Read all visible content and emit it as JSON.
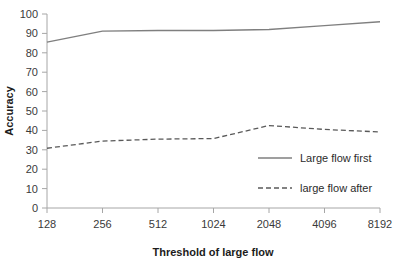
{
  "chart_data": {
    "type": "line",
    "title": "",
    "xlabel": "Threshold of large flow",
    "ylabel": "Accuracy",
    "categories": [
      "128",
      "256",
      "512",
      "1024",
      "2048",
      "4096",
      "8192"
    ],
    "xticklabels": [
      "128",
      "256",
      "512",
      "1024",
      "2048",
      "4096",
      "8192"
    ],
    "yticklabels": [
      "0",
      "10",
      "20",
      "30",
      "40",
      "50",
      "60",
      "70",
      "80",
      "90",
      "100"
    ],
    "yticks": [
      0,
      10,
      20,
      30,
      40,
      50,
      60,
      70,
      80,
      90,
      100
    ],
    "ylim": [
      0,
      100
    ],
    "grid": false,
    "legend_position": "center-right",
    "series": [
      {
        "name": "Large flow first",
        "style": "solid",
        "color": "#7f7f7f",
        "values": [
          85.5,
          91.2,
          91.5,
          91.5,
          92.0,
          94.0,
          96.0
        ]
      },
      {
        "name": "large flow after",
        "style": "dashed",
        "color": "#595959",
        "values": [
          30.8,
          34.5,
          35.5,
          35.8,
          42.5,
          40.5,
          39.2
        ]
      }
    ]
  },
  "legend": {
    "items": [
      {
        "label": "Large flow first",
        "style": "solid"
      },
      {
        "label": "large flow after",
        "style": "dashed"
      }
    ]
  },
  "axes": {
    "x_title": "Threshold of large flow",
    "y_title": "Accuracy"
  }
}
